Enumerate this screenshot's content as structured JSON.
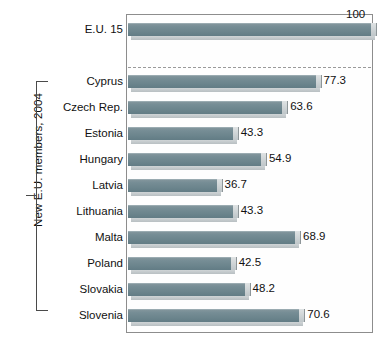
{
  "chart_data": {
    "type": "bar",
    "orientation": "horizontal",
    "title": "",
    "subtitle": "",
    "xlabel": "",
    "ylabel": "New E.U. members, 2004",
    "xlim": [
      0,
      100
    ],
    "grid": false,
    "legend": null,
    "categories": [
      "E.U. 15",
      "Cyprus",
      "Czech Rep.",
      "Estonia",
      "Hungary",
      "Latvia",
      "Lithuania",
      "Malta",
      "Poland",
      "Slovakia",
      "Slovenia"
    ],
    "values": [
      100,
      77.3,
      63.6,
      43.3,
      54.9,
      36.7,
      43.3,
      68.9,
      42.5,
      48.2,
      70.6
    ],
    "value_labels": [
      "100",
      "77.3",
      "63.6",
      "43.3",
      "54.9",
      "36.7",
      "43.3",
      "68.9",
      "42.5",
      "48.2",
      "70.6"
    ],
    "annotations": [
      {
        "name": "group-divider",
        "kind": "dashed-line",
        "after_category": "E.U. 15"
      },
      {
        "name": "group-bracket",
        "kind": "bracket",
        "label": "New E.U. members, 2004",
        "covers": [
          "Cyprus",
          "Czech Rep.",
          "Estonia",
          "Hungary",
          "Latvia",
          "Lithuania",
          "Malta",
          "Poland",
          "Slovakia",
          "Slovenia"
        ]
      }
    ]
  },
  "group_axis": {
    "label": "New E.U. members, 2004"
  },
  "colors": {
    "bar_fill": "#6c858d",
    "bar_bevel": "#c8cfd2",
    "frame": "#8d8d8d",
    "divider": "#9a9a9a",
    "text": "#111111",
    "background": "#ffffff"
  }
}
